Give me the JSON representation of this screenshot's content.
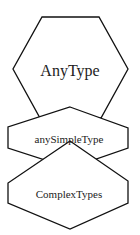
{
  "diagram": {
    "type": "hexagon-hierarchy",
    "nodes": [
      {
        "id": "anytype",
        "label": "AnyType",
        "font_size": 16,
        "points": "42,17 99,17 128,69 101,118 40,118 13,69",
        "text_x": 70,
        "text_y": 72
      },
      {
        "id": "anysimpletype",
        "label": "anySimpleType",
        "font_size": 11,
        "points": "70,107 128,128 128,148 70,168 8,148 8,127",
        "text_x": 69,
        "text_y": 140
      },
      {
        "id": "complextypes",
        "label": "ComplexTypes",
        "font_size": 11,
        "points": "70,141 128,181 128,203 70,229 8,203 8,183",
        "text_x": 69,
        "text_y": 195
      }
    ],
    "colors": {
      "stroke": "#111111",
      "fill": "#ffffff",
      "text": "#222222"
    }
  }
}
